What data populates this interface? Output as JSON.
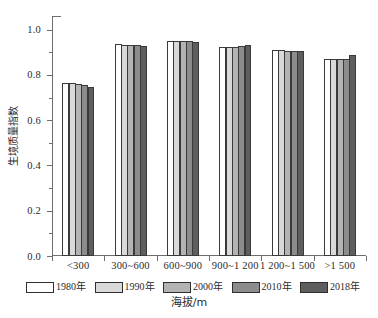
{
  "chart_data": {
    "type": "bar",
    "title": "",
    "subtitle": "",
    "xlabel": "海拔/m",
    "ylabel": "生境质量指数",
    "categories": [
      "<300",
      "300~600",
      "600~900",
      "900~1 200",
      "1 200~1 500",
      ">1 500"
    ],
    "series": [
      {
        "name": "1980年",
        "color": "#ffffff",
        "values": [
          0.763,
          0.935,
          0.95,
          0.925,
          0.908,
          0.868
        ]
      },
      {
        "name": "1990年",
        "color": "#d9d9d9",
        "values": [
          0.762,
          0.934,
          0.949,
          0.924,
          0.908,
          0.871
        ]
      },
      {
        "name": "2000年",
        "color": "#b3b3b3",
        "values": [
          0.76,
          0.934,
          0.949,
          0.923,
          0.907,
          0.869
        ]
      },
      {
        "name": "2010年",
        "color": "#8c8c8c",
        "values": [
          0.757,
          0.933,
          0.949,
          0.927,
          0.907,
          0.868
        ]
      },
      {
        "name": "2018年",
        "color": "#5e5e5e",
        "values": [
          0.748,
          0.928,
          0.944,
          0.931,
          0.906,
          0.889
        ]
      }
    ],
    "ylim": [
      0.0,
      1.06
    ],
    "y_ticks": [
      0.0,
      0.2,
      0.4,
      0.6,
      0.8,
      1.0
    ],
    "y_tick_labels": [
      "0.0",
      "0.2",
      "0.4",
      "0.6",
      "0.8",
      "1.0"
    ],
    "y_minor_ticks": [
      0.1,
      0.3,
      0.5,
      0.7,
      0.9
    ],
    "grid": false,
    "legend_position": "bottom",
    "axis_color": "#6e6e6e",
    "bar_edge_color": "#3a3a3a"
  },
  "axes": {
    "y_title": "生境质量指数",
    "x_title": "海拔/m"
  }
}
